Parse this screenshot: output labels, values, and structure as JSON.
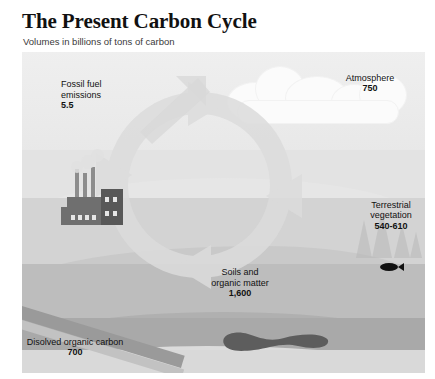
{
  "header": {
    "title": "The Present Carbon Cycle",
    "subtitle": "Volumes in billions of tons of carbon"
  },
  "colors": {
    "page_background": "#ffffff",
    "sky": "#ececec",
    "land": "#e3e3e3",
    "surface_water": "#d3d3d3",
    "mid_water": "#bdbdbd",
    "deep_water": "#a9a9a9",
    "sediment": "#d9d9d9",
    "coal_seam": "#9a9a9a",
    "factory": "#6f6f6f",
    "oil_deposit": "#5d5d5d",
    "label_text": "#111111",
    "deep_label_text": "#ffffff"
  },
  "labels": {
    "fossil_fuel": {
      "line1": "Fossil fuel",
      "line2": "emissions",
      "value": "5.5"
    },
    "atmosphere": {
      "line1": "Atmosphere",
      "value": "750"
    },
    "terrestrial": {
      "line1": "Terrestrial",
      "line2": "vegetation",
      "value": "540-610"
    },
    "soils": {
      "line1": "Soils and",
      "line2": "organic matter",
      "value": "1,600"
    },
    "dissolved": {
      "line1": "Disolved organic carbon",
      "value": "700"
    },
    "marine_organisms": {
      "line1": "Marine organisms",
      "value": "3"
    },
    "deep_water": {
      "line1": "Intermediate",
      "line2": "and deep water",
      "value": "38,000-40,000"
    },
    "coal": {
      "line1": "Coal deposit",
      "value": "3,000"
    },
    "sediments": {
      "line1": "Marine sediments",
      "line2": "and sedimentary rocks",
      "value": "66,000,000-100,000,000"
    },
    "oil_gas": {
      "line1": "Oil and gas deposit",
      "value": "300"
    }
  },
  "icons": {
    "factory": "factory-icon",
    "clouds": "cloud-icon",
    "trees": "conifer-tree-icon",
    "fish": "fish-icon",
    "oil": "oil-deposit-icon",
    "cycle": "circular-arrow-icon"
  }
}
